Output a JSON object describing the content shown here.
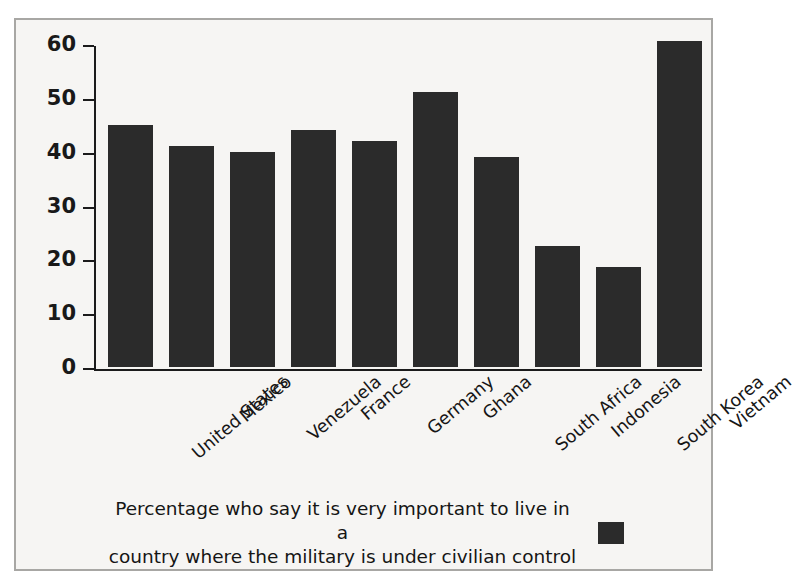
{
  "chart_data": {
    "type": "bar",
    "title": "",
    "subtitle": "",
    "xlabel": "",
    "ylabel": "",
    "ylim": [
      0,
      60
    ],
    "yticks": [
      0,
      10,
      20,
      30,
      40,
      50,
      60
    ],
    "grid": false,
    "legend_position": "bottom",
    "categories": [
      "United States",
      "Mexico",
      "Venezuela",
      "France",
      "Germany",
      "Ghana",
      "South Africa",
      "Indonesia",
      "South Korea",
      "Vietnam"
    ],
    "values": [
      45,
      41,
      40,
      44,
      42,
      51,
      39,
      22.5,
      18.5,
      60.5
    ],
    "series": [
      {
        "name": "Percentage who say it is very important to live in a country where the military is under civilian control",
        "values": [
          45,
          41,
          40,
          44,
          42,
          51,
          39,
          22.5,
          18.5,
          60.5
        ],
        "color": "#2b2b2b"
      }
    ],
    "annotations": []
  },
  "legend": {
    "line1": "Percentage who say it is very important to live in a",
    "line2": "country where the military is under civilian control",
    "swatch_color": "#2b2b2b"
  },
  "colors": {
    "bar": "#2b2b2b",
    "axis": "#1b1b1b",
    "background": "#f6f5f3",
    "frame": "#a8a7a4",
    "text": "#161616"
  }
}
